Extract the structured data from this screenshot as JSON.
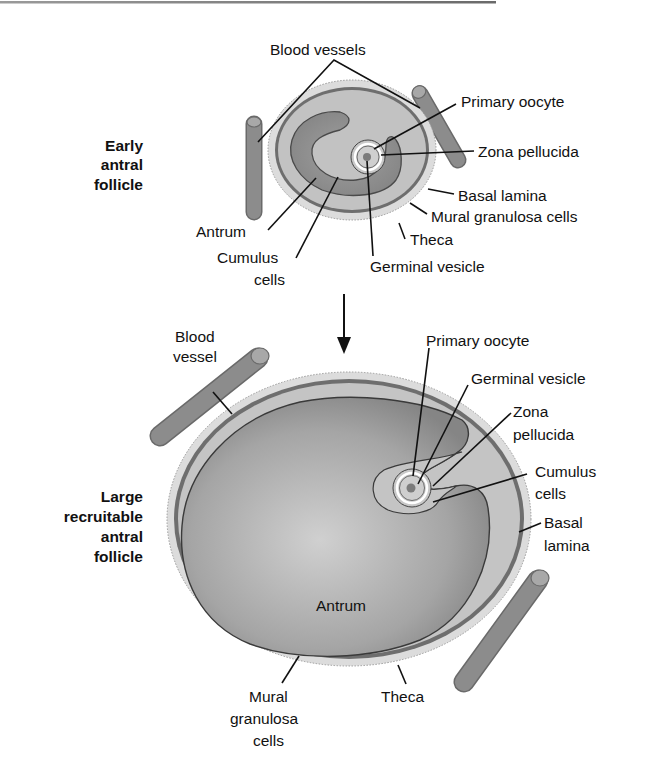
{
  "figure": {
    "top_rule": true,
    "colors": {
      "theca": "#d9d9d9",
      "basal_lamina": "#6e6e6e",
      "granulosa": "#bdbdbd",
      "antrum_small": "#8f8f8f",
      "antrum_large_center": "#c8c8c8",
      "antrum_large_edge": "#888888",
      "vessel": "#8a8a8a",
      "vessel_cap": "#a6a6a6",
      "oocyte": "#cfcfcf",
      "nucleus": "#7a7a7a"
    }
  },
  "early_follicle": {
    "title_lines": [
      "Early",
      "antral",
      "follicle"
    ],
    "labels": {
      "blood_vessels": "Blood vessels",
      "primary_oocyte": "Primary oocyte",
      "zona_pellucida": "Zona pellucida",
      "basal_lamina": "Basal lamina",
      "mural_granulosa": "Mural granulosa cells",
      "theca": "Theca",
      "germinal_vesicle": "Germinal vesicle",
      "antrum": "Antrum",
      "cumulus_lines": [
        "Cumulus",
        "cells"
      ]
    }
  },
  "transition_arrow": "down-arrow",
  "large_follicle": {
    "title_lines": [
      "Large",
      "recruitable",
      "antral",
      "follicle"
    ],
    "labels": {
      "blood_vessel_lines": [
        "Blood",
        "vessel"
      ],
      "primary_oocyte": "Primary oocyte",
      "germinal_vesicle": "Germinal vesicle",
      "zona_lines": [
        "Zona",
        "pellucida"
      ],
      "cumulus_lines": [
        "Cumulus",
        "cells"
      ],
      "basal_lines": [
        "Basal",
        "lamina"
      ],
      "antrum": "Antrum",
      "mural_lines": [
        "Mural",
        "granulosa",
        "cells"
      ],
      "theca": "Theca"
    }
  }
}
